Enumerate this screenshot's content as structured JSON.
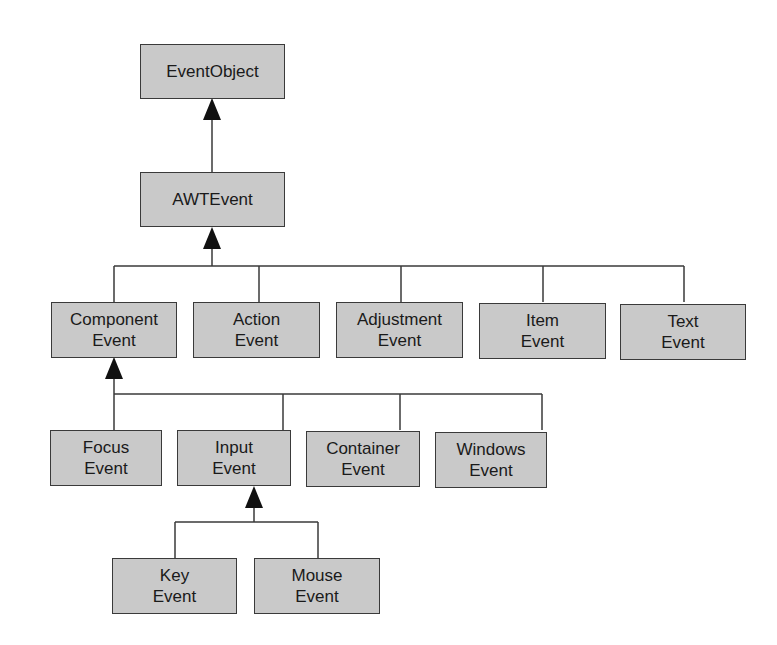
{
  "diagram": {
    "type": "class-hierarchy",
    "colors": {
      "box_fill": "#c9c9c9",
      "box_border": "#3a3a3a",
      "line": "#3a3a3a",
      "arrow": "#111111",
      "text": "#1a1a1a",
      "background": "#ffffff"
    },
    "nodes": {
      "event_object": {
        "line1": "EventObject",
        "line2": ""
      },
      "awt_event": {
        "line1": "AWTEvent",
        "line2": ""
      },
      "component_event": {
        "line1": "Component",
        "line2": "Event"
      },
      "action_event": {
        "line1": "Action",
        "line2": "Event"
      },
      "adjustment_event": {
        "line1": "Adjustment",
        "line2": "Event"
      },
      "item_event": {
        "line1": "Item",
        "line2": "Event"
      },
      "text_event": {
        "line1": "Text",
        "line2": "Event"
      },
      "focus_event": {
        "line1": "Focus",
        "line2": "Event"
      },
      "input_event": {
        "line1": "Input",
        "line2": "Event"
      },
      "container_event": {
        "line1": "Container",
        "line2": "Event"
      },
      "windows_event": {
        "line1": "Windows",
        "line2": "Event"
      },
      "key_event": {
        "line1": "Key",
        "line2": "Event"
      },
      "mouse_event": {
        "line1": "Mouse",
        "line2": "Event"
      }
    },
    "edges": [
      {
        "child": "AWTEvent",
        "parent": "EventObject"
      },
      {
        "child": "Component Event",
        "parent": "AWTEvent"
      },
      {
        "child": "Action Event",
        "parent": "AWTEvent"
      },
      {
        "child": "Adjustment Event",
        "parent": "AWTEvent"
      },
      {
        "child": "Item Event",
        "parent": "AWTEvent"
      },
      {
        "child": "Text Event",
        "parent": "AWTEvent"
      },
      {
        "child": "Focus Event",
        "parent": "Component Event"
      },
      {
        "child": "Input Event",
        "parent": "Component Event"
      },
      {
        "child": "Container Event",
        "parent": "Component Event"
      },
      {
        "child": "Windows Event",
        "parent": "Component Event"
      },
      {
        "child": "Key Event",
        "parent": "Input Event"
      },
      {
        "child": "Mouse Event",
        "parent": "Input Event"
      }
    ]
  }
}
